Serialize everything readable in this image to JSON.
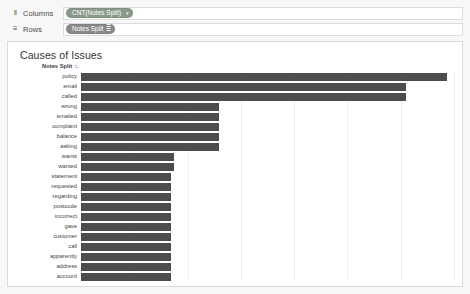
{
  "shelves": [
    {
      "name": "columns",
      "label": "Columns",
      "icon": "columns-icon",
      "glyph": "‖",
      "pill": {
        "label": "CNT(Notes Split)",
        "style": "green",
        "trailing": "caret"
      }
    },
    {
      "name": "rows",
      "label": "Rows",
      "icon": "rows-icon",
      "glyph": "≡",
      "pill": {
        "label": "Notes Split",
        "style": "grey",
        "trailing": "sort"
      }
    }
  ],
  "viz": {
    "title": "Causes of Issues",
    "column_header": "Notes Split",
    "column_header_sort_glyph": "↑̵"
  },
  "chart_data": {
    "type": "bar",
    "orientation": "horizontal",
    "title": "Causes of Issues",
    "xlabel": "",
    "ylabel": "Notes Split",
    "grid": true,
    "gridline_positions_pct": [
      14.3,
      28.6,
      42.9,
      57.1,
      71.4,
      85.7,
      100
    ],
    "legend": "none",
    "bar_color": "#4d4d4d",
    "xlim": [
      0,
      100
    ],
    "categories": [
      "policy",
      "email",
      "called",
      "wrong",
      "emailed",
      "complaint",
      "balance",
      "asking",
      "wants",
      "wanted",
      "statement",
      "requested",
      "regarding",
      "postcode",
      "incorrect",
      "gave",
      "customer",
      "call",
      "apparently",
      "address",
      "account"
    ],
    "values": [
      98,
      87,
      87,
      37,
      37,
      37,
      37,
      37,
      25,
      25,
      24,
      24,
      24,
      24,
      24,
      24,
      24,
      24,
      24,
      24,
      24
    ]
  }
}
